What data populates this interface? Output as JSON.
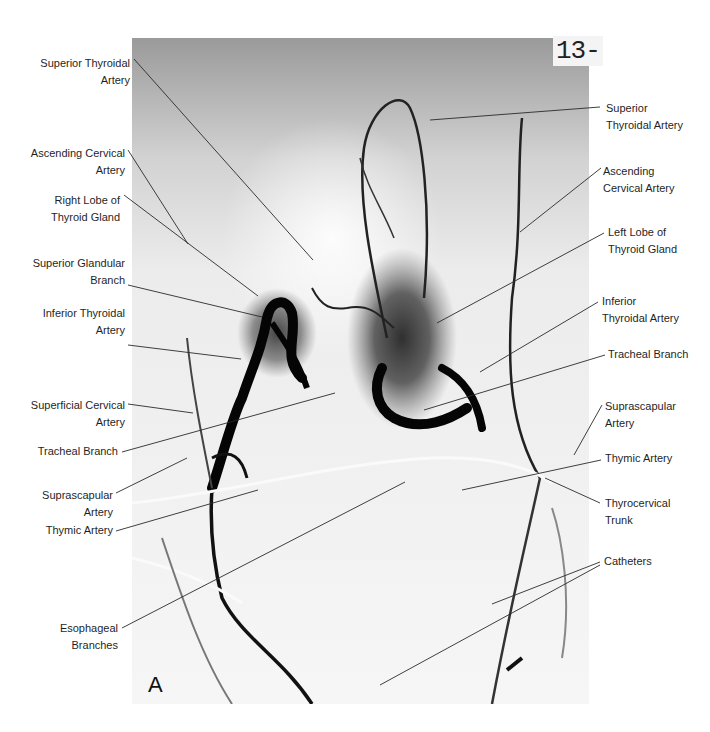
{
  "figure": {
    "panel_letter": "A",
    "film_number": "13-",
    "image_description": "Selective angiogram of the thyroid region (thyrocervical trunk injection)",
    "colors": {
      "background": "#ffffff",
      "label_text": "#1f1f1f",
      "leader_line": "#2a2a2a",
      "vessel": "#0a0a0a",
      "film_bg": "#d8d8d8"
    }
  },
  "labels_left": [
    {
      "id": "sup-thyroid-artery-r",
      "lines": [
        "Superior Thyroidal",
        "Artery"
      ],
      "x": 130,
      "y": 55,
      "leader": [
        [
          134,
          59
        ],
        [
          313,
          260
        ]
      ]
    },
    {
      "id": "ascending-cervical-r",
      "lines": [
        "Ascending Cervical",
        "Artery"
      ],
      "x": 125,
      "y": 145,
      "leader": [
        [
          128,
          150
        ],
        [
          188,
          244
        ]
      ]
    },
    {
      "id": "right-lobe",
      "lines": [
        "Right Lobe of",
        "Thyroid Gland"
      ],
      "x": 120,
      "y": 192,
      "leader": [
        [
          124,
          195
        ],
        [
          258,
          296
        ]
      ]
    },
    {
      "id": "sup-glandular-branch",
      "lines": [
        "Superior Glandular",
        "Branch"
      ],
      "x": 125,
      "y": 255,
      "leader": [
        [
          128,
          285
        ],
        [
          262,
          317
        ]
      ]
    },
    {
      "id": "inf-thyroid-artery-r",
      "lines": [
        "Inferior Thyroidal",
        "Artery"
      ],
      "x": 125,
      "y": 305,
      "leader": [
        [
          128,
          345
        ],
        [
          241,
          359
        ]
      ]
    },
    {
      "id": "superficial-cervical",
      "lines": [
        "Superficial Cervical",
        "Artery"
      ],
      "x": 125,
      "y": 397,
      "leader": [
        [
          128,
          404
        ],
        [
          193,
          413
        ]
      ]
    },
    {
      "id": "tracheal-branch-r",
      "lines": [
        "Tracheal Branch"
      ],
      "x": 118,
      "y": 443,
      "leader": [
        [
          122,
          452
        ],
        [
          335,
          393
        ]
      ]
    },
    {
      "id": "suprascapular-r",
      "lines": [
        "Suprascapular",
        "Artery"
      ],
      "x": 113,
      "y": 487,
      "leader": [
        [
          116,
          493
        ],
        [
          187,
          458
        ]
      ]
    },
    {
      "id": "thymic-artery-r",
      "lines": [
        "Thymic Artery"
      ],
      "x": 113,
      "y": 522,
      "leader": [
        [
          116,
          531
        ],
        [
          258,
          490
        ]
      ]
    },
    {
      "id": "esophageal-branches",
      "lines": [
        "Esophageal",
        "Branches"
      ],
      "x": 118,
      "y": 620,
      "leader": [
        [
          122,
          628
        ],
        [
          405,
          482
        ]
      ]
    }
  ],
  "labels_right": [
    {
      "id": "sup-thyroid-artery-l",
      "lines": [
        "Superior",
        "Thyroidal Artery"
      ],
      "x": 606,
      "y": 100,
      "leader": [
        [
          600,
          107
        ],
        [
          430,
          120
        ]
      ]
    },
    {
      "id": "ascending-cervical-l",
      "lines": [
        "Ascending",
        "Cervical Artery"
      ],
      "x": 603,
      "y": 163,
      "leader": [
        [
          601,
          168
        ],
        [
          520,
          232
        ]
      ]
    },
    {
      "id": "left-lobe",
      "lines": [
        "Left Lobe of",
        "Thyroid Gland"
      ],
      "x": 608,
      "y": 224,
      "leader": [
        [
          604,
          233
        ],
        [
          437,
          323
        ]
      ]
    },
    {
      "id": "inf-thyroid-artery-l",
      "lines": [
        "Inferior",
        "Thyroidal Artery"
      ],
      "x": 602,
      "y": 293,
      "leader": [
        [
          598,
          302
        ],
        [
          480,
          372
        ]
      ]
    },
    {
      "id": "tracheal-branch-l",
      "lines": [
        "Tracheal Branch"
      ],
      "x": 608,
      "y": 346,
      "leader": [
        [
          605,
          355
        ],
        [
          424,
          410
        ]
      ]
    },
    {
      "id": "suprascapular-l",
      "lines": [
        "Suprascapular",
        "Artery"
      ],
      "x": 605,
      "y": 398,
      "leader": [
        [
          602,
          405
        ],
        [
          574,
          455
        ]
      ]
    },
    {
      "id": "thymic-artery-l",
      "lines": [
        "Thymic Artery"
      ],
      "x": 605,
      "y": 450,
      "leader": [
        [
          601,
          460
        ],
        [
          462,
          490
        ]
      ]
    },
    {
      "id": "thyrocervical-trunk",
      "lines": [
        "Thyrocervical",
        "Trunk"
      ],
      "x": 605,
      "y": 495,
      "leader": [
        [
          600,
          503
        ],
        [
          545,
          478
        ]
      ]
    },
    {
      "id": "catheters",
      "lines": [
        "Catheters"
      ],
      "x": 604,
      "y": 553,
      "leader": [
        [
          600,
          562
        ],
        [
          492,
          604
        ],
        [
          600,
          565
        ],
        [
          380,
          685
        ]
      ]
    }
  ],
  "panel_letter_pos": {
    "x": 148,
    "y": 672
  },
  "film_number_pos": {
    "x": 553,
    "y": 36
  }
}
